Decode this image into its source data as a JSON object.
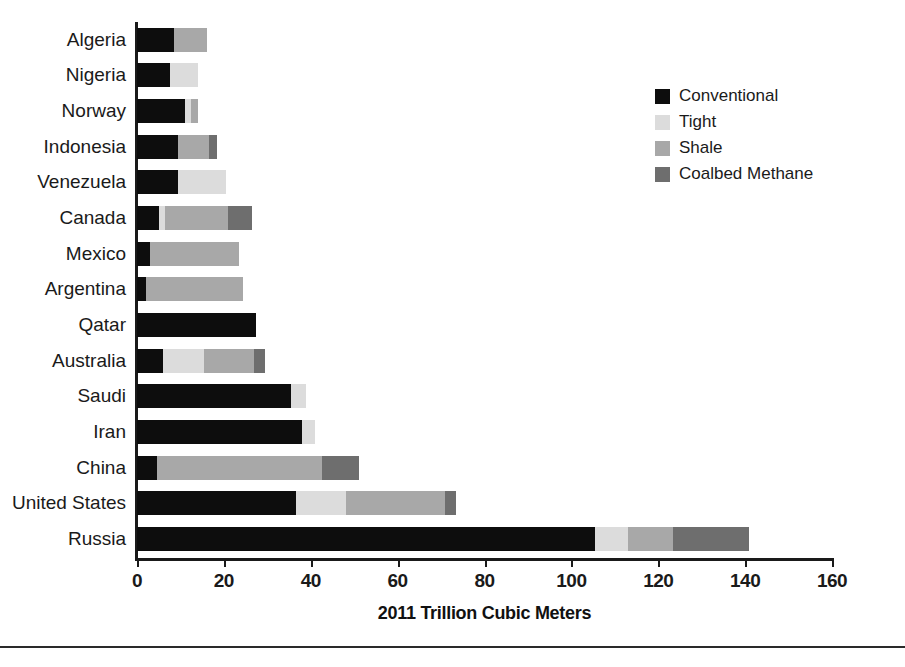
{
  "chart_data": {
    "type": "bar",
    "orientation": "horizontal",
    "stacked": true,
    "title": "",
    "xlabel": "2011 Trillion Cubic Meters",
    "ylabel": "",
    "xlim": [
      0,
      160
    ],
    "xticks": [
      0,
      20,
      40,
      60,
      80,
      100,
      120,
      140,
      160
    ],
    "grid": false,
    "legend_position": "top-right",
    "categories": [
      "Algeria",
      "Nigeria",
      "Norway",
      "Indonesia",
      "Venezuela",
      "Canada",
      "Mexico",
      "Argentina",
      "Qatar",
      "Australia",
      "Saudi",
      "Iran",
      "China",
      "United States",
      "Russia"
    ],
    "series": [
      {
        "name": "Conventional",
        "color": "#0d0d0d",
        "values": [
          8.5,
          7.5,
          11.0,
          9.5,
          9.5,
          5.0,
          3.0,
          2.0,
          27.5,
          6.0,
          35.5,
          38.0,
          4.5,
          36.5,
          105.5
        ]
      },
      {
        "name": "Tight",
        "color": "#dcdcdc",
        "values": [
          0.0,
          6.5,
          1.5,
          0.0,
          11.0,
          1.5,
          0.0,
          0.0,
          0.0,
          9.5,
          3.5,
          3.0,
          0.0,
          11.5,
          7.5
        ]
      },
      {
        "name": "Shale",
        "color": "#a8a8a8",
        "values": [
          7.5,
          0.0,
          1.5,
          7.0,
          0.0,
          14.5,
          20.5,
          22.5,
          0.0,
          11.5,
          0.0,
          0.0,
          38.0,
          23.0,
          10.5
        ]
      },
      {
        "name": "Coalbed Methane",
        "color": "#6e6e6e",
        "values": [
          0.0,
          0.0,
          0.0,
          2.0,
          0.0,
          5.5,
          0.0,
          0.0,
          0.0,
          2.5,
          0.0,
          0.0,
          8.5,
          2.5,
          17.5
        ]
      }
    ],
    "totals": [
      16.0,
      14.0,
      14.0,
      18.5,
      20.5,
      26.5,
      23.5,
      24.5,
      27.5,
      29.5,
      39.0,
      41.0,
      51.0,
      73.5,
      141.0
    ]
  },
  "legend": {
    "items": [
      {
        "label": "Conventional",
        "color": "#0d0d0d"
      },
      {
        "label": "Tight",
        "color": "#dcdcdc"
      },
      {
        "label": "Shale",
        "color": "#a8a8a8"
      },
      {
        "label": "Coalbed Methane",
        "color": "#6e6e6e"
      }
    ]
  },
  "axis": {
    "x_title": "2011 Trillion Cubic Meters",
    "tick_labels": [
      "0",
      "20",
      "40",
      "60",
      "80",
      "100",
      "120",
      "140",
      "160"
    ]
  }
}
